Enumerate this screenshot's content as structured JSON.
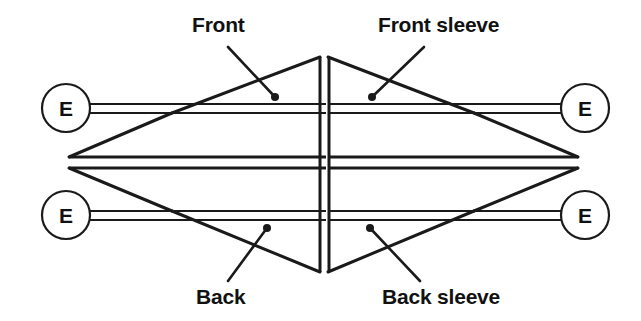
{
  "diagram": {
    "type": "schematic",
    "background_color": "#ffffff",
    "stroke_color": "#1a1a1a",
    "labels": {
      "front": "Front",
      "front_sleeve": "Front sleeve",
      "back": "Back",
      "back_sleeve": "Back sleeve"
    },
    "needles": [
      {
        "id": "needle-top-left",
        "letter": "E",
        "cx": 66,
        "cy": 108
      },
      {
        "id": "needle-top-right",
        "letter": "E",
        "cx": 585,
        "cy": 108
      },
      {
        "id": "needle-bottom-left",
        "letter": "E",
        "cx": 66,
        "cy": 215
      },
      {
        "id": "needle-bottom-right",
        "letter": "E",
        "cx": 585,
        "cy": 215
      }
    ],
    "leader_dots": [
      {
        "for": "front",
        "x": 275,
        "y": 97
      },
      {
        "for": "front_sleeve",
        "x": 372,
        "y": 97
      },
      {
        "for": "back",
        "x": 267,
        "y": 228
      },
      {
        "for": "back_sleeve",
        "x": 370,
        "y": 228
      }
    ],
    "panel_count": 4,
    "panel_names": [
      "Front",
      "Front sleeve",
      "Back",
      "Back sleeve"
    ]
  }
}
